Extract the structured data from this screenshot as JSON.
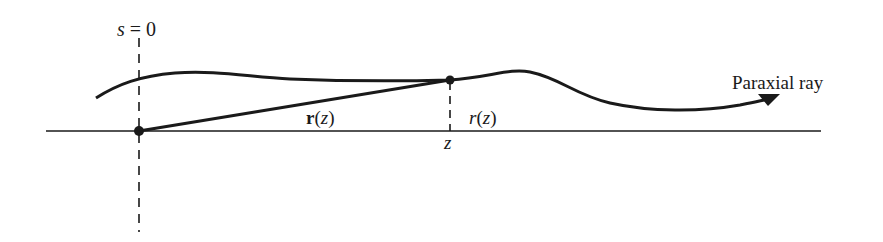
{
  "diagram": {
    "type": "paraxial ray geometry",
    "labels": {
      "s_var": "s",
      "s_eq": " = 0",
      "r_vec_bold": "r",
      "r_vec_paren_open": "(",
      "r_vec_arg": "z",
      "r_vec_paren_close": ")",
      "r_scalar": "r",
      "r_scalar_paren_open": "(",
      "r_scalar_arg": "z",
      "r_scalar_paren_close": ")",
      "z_axis_tick": "z",
      "ray_label": "Paraxial ray"
    },
    "colors": {
      "ink": "#1a1a1a",
      "background": "#ffffff"
    },
    "elements": {
      "optical_axis": "horizontal line",
      "reference_plane": "dashed vertical line at s = 0",
      "position_vector": "line from origin to point on ray",
      "height_marker": "dashed vertical line at z",
      "ray": "curved line with arrow"
    }
  }
}
